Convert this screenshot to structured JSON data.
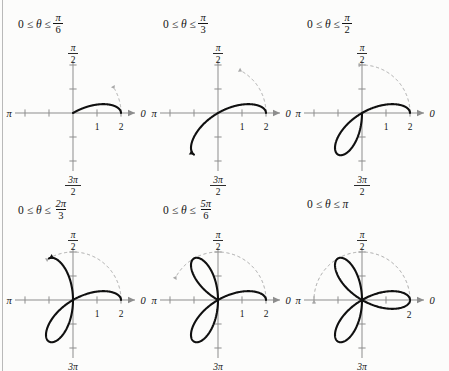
{
  "figure": {
    "title": "",
    "curve_equation": "r = 2 cos 3θ",
    "colors": {
      "background": "#fcfcfb",
      "axis": "#8d8d8d",
      "curve": "#101010",
      "guide_dashed": "#a8a8a8",
      "text": "#141414",
      "rule": "#b9b9b9"
    },
    "axis_labels": {
      "right": "0",
      "left": "π",
      "top_num": "π",
      "top_den": "2",
      "bottom_num": "3π",
      "bottom_den": "2",
      "tick_one": "1",
      "tick_two": "2"
    },
    "panels": [
      {
        "id": "panel-pi-6",
        "caption_prefix": "0 ≤",
        "caption_theta": "θ",
        "caption_mid": "≤",
        "caption_num": "π",
        "caption_den": "6",
        "caption_plain": "",
        "theta_max_label": "π/6",
        "theta_max_value": 0.5235987756,
        "xlabels": [
          "1",
          "2"
        ]
      },
      {
        "id": "panel-pi-3",
        "caption_prefix": "0 ≤",
        "caption_theta": "θ",
        "caption_mid": "≤",
        "caption_num": "π",
        "caption_den": "3",
        "caption_plain": "",
        "theta_max_label": "π/3",
        "theta_max_value": 1.0471975512,
        "xlabels": [
          "1",
          "2"
        ]
      },
      {
        "id": "panel-pi-2",
        "caption_prefix": "0 ≤",
        "caption_theta": "θ",
        "caption_mid": "≤",
        "caption_num": "π",
        "caption_den": "2",
        "caption_plain": "",
        "theta_max_label": "π/2",
        "theta_max_value": 1.5707963268,
        "xlabels": [
          "1",
          "2"
        ]
      },
      {
        "id": "panel-2pi-3",
        "caption_prefix": "0 ≤",
        "caption_theta": "θ",
        "caption_mid": "≤",
        "caption_num": "2π",
        "caption_den": "3",
        "caption_plain": "",
        "theta_max_label": "2π/3",
        "theta_max_value": 2.0943951024,
        "xlabels": [
          "1",
          "2"
        ]
      },
      {
        "id": "panel-5pi-6",
        "caption_prefix": "0 ≤",
        "caption_theta": "θ",
        "caption_mid": "≤",
        "caption_num": "5π",
        "caption_den": "6",
        "caption_plain": "",
        "theta_max_label": "5π/6",
        "theta_max_value": 2.617993878,
        "xlabels": [
          "1",
          "2"
        ]
      },
      {
        "id": "panel-pi",
        "caption_prefix": "0 ≤",
        "caption_theta": "θ",
        "caption_mid": "≤",
        "caption_num": "",
        "caption_den": "",
        "caption_plain": "π",
        "theta_max_label": "π",
        "theta_max_value": 3.1415926536,
        "xlabels": [
          "2"
        ]
      }
    ]
  },
  "chart_data": {
    "type": "line",
    "subtitle": "Six polar plots showing the curve drawn for increasing θ intervals",
    "polar_equation": "r = 2 cos(3θ)",
    "amplitude": 2,
    "petal_count": 3,
    "xlabel": "",
    "ylabel": "",
    "xlim": [
      -2.4,
      2.4
    ],
    "ylim": [
      -2.4,
      2.4
    ],
    "grid": false,
    "legend": "none",
    "axis_tick_values": [
      -2,
      -1,
      1,
      2
    ],
    "angle_axis_labels": {
      "0": "0",
      "pi_over_2": "π/2",
      "pi": "π",
      "three_pi_over_2": "3π/2"
    },
    "series": [
      {
        "name": "0 ≤ θ ≤ π/6",
        "theta_start": 0,
        "theta_end": 0.5235987756,
        "guide_arc_end": 0.5235987756
      },
      {
        "name": "0 ≤ θ ≤ π/3",
        "theta_start": 0,
        "theta_end": 1.0471975512,
        "guide_arc_end": 1.0471975512
      },
      {
        "name": "0 ≤ θ ≤ π/2",
        "theta_start": 0,
        "theta_end": 1.5707963268,
        "guide_arc_end": 1.5707963268
      },
      {
        "name": "0 ≤ θ ≤ 2π/3",
        "theta_start": 0,
        "theta_end": 2.0943951024,
        "guide_arc_end": 2.0943951024
      },
      {
        "name": "0 ≤ θ ≤ 5π/6",
        "theta_start": 0,
        "theta_end": 2.617993878,
        "guide_arc_end": 2.617993878
      },
      {
        "name": "0 ≤ θ ≤ π",
        "theta_start": 0,
        "theta_end": 3.1415926536,
        "guide_arc_end": 3.1415926536
      }
    ]
  }
}
